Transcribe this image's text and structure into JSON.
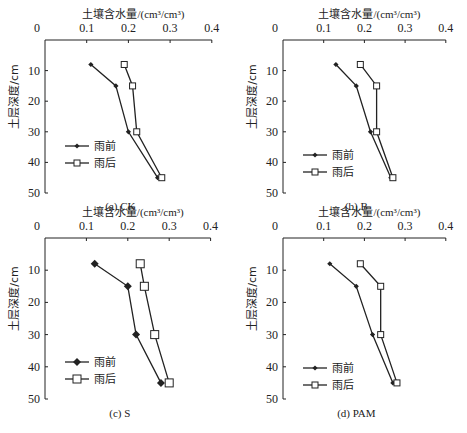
{
  "figure": {
    "x_axis_title": "土壤含水量/(cm³/cm³)",
    "y_axis_title": "土层深度/cm",
    "x_ticks": [
      "0",
      "0.1",
      "0.2",
      "0.3",
      "0.4"
    ],
    "y_ticks": [
      "0",
      "10",
      "20",
      "30",
      "40",
      "50"
    ],
    "legend": [
      "雨前",
      "雨后"
    ]
  },
  "chart_data": [
    {
      "type": "line",
      "title": "(a) CK",
      "xlabel": "土壤含水量/(cm³/cm³)",
      "ylabel": "土层深度/cm",
      "xlim": [
        0,
        0.4
      ],
      "ylim": [
        0,
        50
      ],
      "y_inverted": true,
      "x_axis_position": "top",
      "depths": [
        8,
        15,
        30,
        45
      ],
      "series": [
        {
          "name": "雨前",
          "marker": "filled-diamond",
          "values": [
            0.11,
            0.17,
            0.2,
            0.27
          ]
        },
        {
          "name": "雨后",
          "marker": "open-square",
          "values": [
            0.19,
            0.21,
            0.22,
            0.28
          ]
        }
      ],
      "legend_position": "lower-left",
      "grid": false
    },
    {
      "type": "line",
      "title": "(b) B",
      "xlabel": "土壤含水量/(cm³/cm³)",
      "ylabel": "土层深度/cm",
      "xlim": [
        0,
        0.4
      ],
      "ylim": [
        0,
        50
      ],
      "y_inverted": true,
      "x_axis_position": "top",
      "depths": [
        8,
        15,
        30,
        45
      ],
      "series": [
        {
          "name": "雨前",
          "marker": "filled-diamond",
          "values": [
            0.13,
            0.18,
            0.215,
            0.265
          ]
        },
        {
          "name": "雨后",
          "marker": "open-square",
          "values": [
            0.19,
            0.23,
            0.23,
            0.27
          ]
        }
      ],
      "legend_position": "lower-left",
      "grid": false
    },
    {
      "type": "line",
      "title": "(c) S",
      "xlabel": "土壤含水量/(cm³/cm³)",
      "ylabel": "土层深度/cm",
      "xlim": [
        0,
        0.4
      ],
      "ylim": [
        0,
        50
      ],
      "y_inverted": true,
      "x_axis_position": "top",
      "depths": [
        8,
        15,
        30,
        45
      ],
      "series": [
        {
          "name": "雨前",
          "marker": "filled-diamond",
          "values": [
            0.12,
            0.2,
            0.22,
            0.28
          ]
        },
        {
          "name": "雨后",
          "marker": "open-square",
          "values": [
            0.23,
            0.24,
            0.265,
            0.3
          ]
        }
      ],
      "legend_position": "lower-left",
      "grid": false
    },
    {
      "type": "line",
      "title": "(d) PAM",
      "xlabel": "土壤含水量/(cm³/cm³)",
      "ylabel": "土层深度/cm",
      "xlim": [
        0,
        0.4
      ],
      "ylim": [
        0,
        50
      ],
      "y_inverted": true,
      "x_axis_position": "top",
      "depths": [
        8,
        15,
        30,
        45
      ],
      "series": [
        {
          "name": "雨前",
          "marker": "filled-diamond",
          "values": [
            0.115,
            0.18,
            0.22,
            0.27
          ]
        },
        {
          "name": "雨后",
          "marker": "open-square",
          "values": [
            0.19,
            0.24,
            0.24,
            0.28
          ]
        }
      ],
      "legend_position": "lower-left",
      "grid": false
    }
  ],
  "panels_layout": [
    {
      "x0": 45,
      "y0": 40,
      "xscale": 417,
      "yscale": 3.06,
      "ytitle_y": 70,
      "caption_y": 210,
      "legend_y": 146
    },
    {
      "x0": 283,
      "y0": 40,
      "xscale": 407,
      "yscale": 3.06,
      "ytitle_y": 70,
      "caption_y": 210,
      "legend_y": 155
    },
    {
      "x0": 45,
      "y0": 238,
      "xscale": 414,
      "yscale": 3.22,
      "ytitle_y": 268,
      "caption_y": 417,
      "legend_y": 362
    },
    {
      "x0": 283,
      "y0": 238,
      "xscale": 407,
      "yscale": 3.22,
      "ytitle_y": 268,
      "caption_y": 417,
      "legend_y": 368
    }
  ],
  "colors": {
    "line": "#222222",
    "background": "#ffffff"
  }
}
